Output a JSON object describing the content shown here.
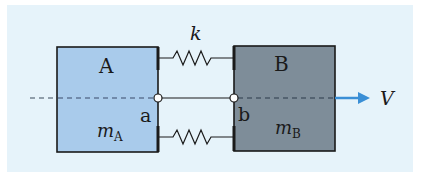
{
  "diagram": {
    "type": "two-mass spring system",
    "colors": {
      "background": "#e6f3fa",
      "block_a_fill": "#a9cbeb",
      "block_b_fill": "#7e8d99",
      "outline": "#1a1a1a",
      "velocity_arrow": "#3a8fd6"
    },
    "block_a": {
      "label": "A",
      "mass_symbol": "m",
      "mass_subscript": "A",
      "point": "a"
    },
    "block_b": {
      "label": "B",
      "mass_symbol": "m",
      "mass_subscript": "B",
      "point": "b"
    },
    "spring": {
      "label": "k",
      "count": 2
    },
    "velocity": {
      "label": "V"
    }
  }
}
